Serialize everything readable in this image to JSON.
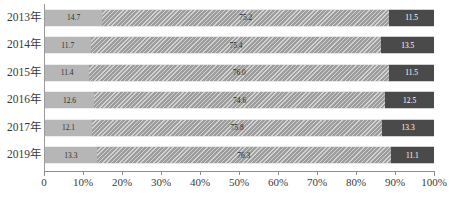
{
  "chart_data": {
    "type": "bar",
    "orientation": "horizontal",
    "stacked": true,
    "normalized": true,
    "title": "",
    "subtitle": "",
    "xlabel": "",
    "ylabel": "",
    "grid": false,
    "legend": null,
    "xlim": [
      0,
      100
    ],
    "xticks": [
      0,
      10,
      20,
      30,
      40,
      50,
      60,
      70,
      80,
      90,
      100
    ],
    "xtick_labels": [
      "0",
      "10%",
      "20%",
      "30%",
      "40%",
      "50%",
      "60%",
      "70%",
      "80%",
      "90%",
      "100%"
    ],
    "categories": [
      "2013年",
      "2014年",
      "2015年",
      "2016年",
      "2017年",
      "2019年"
    ],
    "series": [
      {
        "name": "series-1",
        "color": "#b6b6b6",
        "pattern": "solid",
        "values": [
          14.7,
          11.7,
          11.4,
          12.6,
          12.1,
          13.3
        ],
        "labels": [
          "14.7",
          "11.7",
          "11.4",
          "12.6",
          "12.1",
          "13.3"
        ]
      },
      {
        "name": "series-2",
        "color": "#9d9d9d",
        "pattern": "diagonal-hatch",
        "values": [
          73.8,
          74.8,
          77.1,
          74.9,
          74.6,
          75.6
        ],
        "labels": [
          "75.2",
          "75.4",
          "76.0",
          "74.6",
          "75.8",
          "76.3"
        ]
      },
      {
        "name": "series-3",
        "color": "#4a4a4a",
        "pattern": "solid",
        "values": [
          11.5,
          13.5,
          11.5,
          12.5,
          13.3,
          11.1
        ],
        "labels": [
          "11.5",
          "13.5",
          "11.5",
          "12.5",
          "13.3",
          "11.1"
        ]
      }
    ]
  },
  "axis": {
    "tick_labels": [
      "0",
      "10%",
      "20%",
      "30%",
      "40%",
      "50%",
      "60%",
      "70%",
      "80%",
      "90%",
      "100%"
    ]
  }
}
